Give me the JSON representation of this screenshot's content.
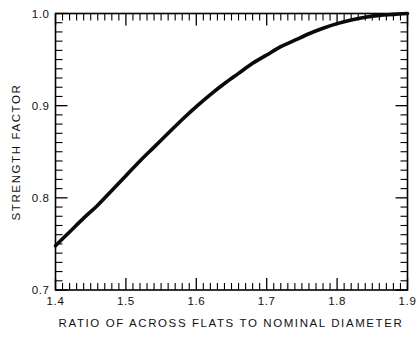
{
  "chart_data": {
    "type": "line",
    "title": "",
    "subtitle": "",
    "xlabel": "RATIO OF ACROSS FLATS TO NOMINAL DIAMETER",
    "ylabel": "STRENGTH FACTOR",
    "xlim": [
      1.4,
      1.9
    ],
    "ylim": [
      0.7,
      1.0
    ],
    "x_major_ticks": [
      1.4,
      1.5,
      1.6,
      1.7,
      1.8,
      1.9
    ],
    "y_major_ticks": [
      0.7,
      0.8,
      0.9,
      1.0
    ],
    "x_tick_labels": [
      "1.4",
      "1.5",
      "1.6",
      "1.7",
      "1.8",
      "1.9"
    ],
    "y_tick_labels": [
      "0.7",
      "0.8",
      "0.9",
      "1.0"
    ],
    "x_minor_step": 0.01,
    "y_minor_step": 0.01,
    "grid": false,
    "legend": null,
    "legend_position": "none",
    "line_color": "#000000",
    "series": [
      {
        "name": "strength factor",
        "x": [
          1.4,
          1.42,
          1.44,
          1.46,
          1.48,
          1.5,
          1.52,
          1.54,
          1.56,
          1.58,
          1.6,
          1.62,
          1.64,
          1.66,
          1.68,
          1.7,
          1.72,
          1.74,
          1.76,
          1.78,
          1.8,
          1.82,
          1.84,
          1.86,
          1.88,
          1.9
        ],
        "y": [
          0.748,
          0.763,
          0.778,
          0.792,
          0.808,
          0.824,
          0.84,
          0.855,
          0.87,
          0.885,
          0.899,
          0.912,
          0.924,
          0.935,
          0.946,
          0.955,
          0.964,
          0.971,
          0.978,
          0.984,
          0.989,
          0.993,
          0.996,
          0.998,
          0.999,
          1.0
        ]
      }
    ]
  },
  "axis_labels": {
    "y_title": "STRENGTH FACTOR",
    "x_title": "RATIO OF ACROSS FLATS TO NOMINAL DIAMETER"
  }
}
